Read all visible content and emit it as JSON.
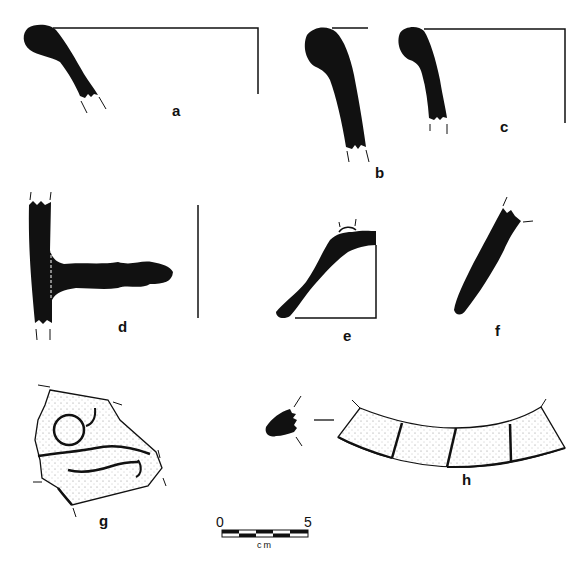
{
  "figure": {
    "type": "archaeological pottery profile plate",
    "ink_color": "#111111",
    "background": "#ffffff",
    "stipple_color": "#777777"
  },
  "sherds": [
    {
      "id": "a",
      "label": "a",
      "kind": "rim profile with rolled lip, section"
    },
    {
      "id": "b",
      "label": "b",
      "kind": "rim profile with rolled lip, section"
    },
    {
      "id": "c",
      "label": "c",
      "kind": "rim profile with rolled lip, section"
    },
    {
      "id": "d",
      "label": "d",
      "kind": "wall section with horizontal lug/handle"
    },
    {
      "id": "e",
      "label": "e",
      "kind": "shoulder / carinated profile"
    },
    {
      "id": "f",
      "label": "f",
      "kind": "body sherd section"
    },
    {
      "id": "g",
      "label": "g",
      "kind": "decorated sherd with incised circle and wavy lines"
    },
    {
      "id": "h",
      "label": "h",
      "kind": "segmented band fragment with section"
    }
  ],
  "scale_bar": {
    "start_label": "0",
    "end_label": "5",
    "unit": "cm",
    "segments": 5
  }
}
